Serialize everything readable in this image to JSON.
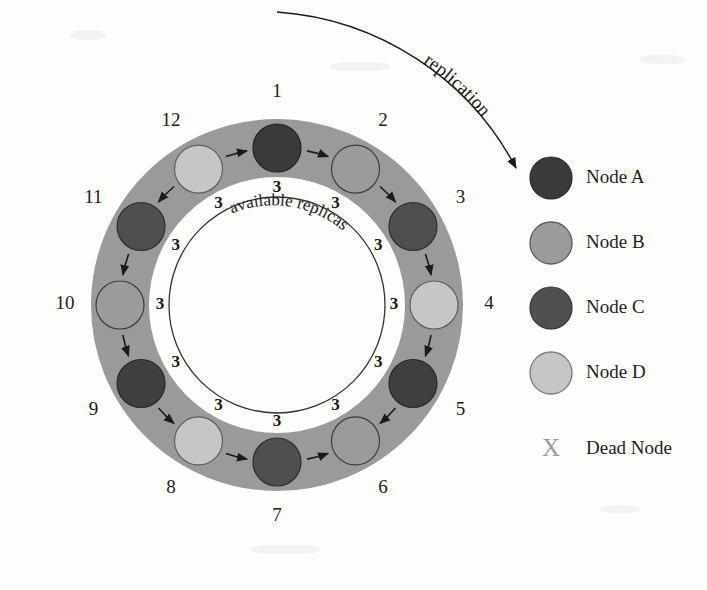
{
  "figure": {
    "title_visible": false,
    "background_color": "#fdfdfc",
    "ring_band_color": "#9a9a9a",
    "ring_inner_fill": "#ffffff",
    "arrow_color": "#1b1b1b",
    "curve_label": "replication",
    "inner_circle_label": "available replicas"
  },
  "ring": {
    "center_x": 277,
    "center_y": 305,
    "band_outer_radius": 186,
    "band_inner_radius": 128,
    "node_orbit_radius": 157,
    "node_radius": 24,
    "inner_circle_radius": 108,
    "replica_label_radius": 117,
    "position_label_radius": 212
  },
  "nodes": [
    {
      "position": "1",
      "node_type": "Node A",
      "color": "#3a3a3a",
      "angle_deg": -90
    },
    {
      "position": "2",
      "node_type": "Node B",
      "color": "#9b9b9b",
      "angle_deg": -60
    },
    {
      "position": "3",
      "node_type": "Node C",
      "color": "#4f4f4f",
      "angle_deg": -30
    },
    {
      "position": "4",
      "node_type": "Node D",
      "color": "#c6c6c6",
      "angle_deg": 0
    },
    {
      "position": "5",
      "node_type": "Node A",
      "color": "#3f3f3f",
      "angle_deg": 30
    },
    {
      "position": "6",
      "node_type": "Node B",
      "color": "#9b9b9b",
      "angle_deg": 60
    },
    {
      "position": "7",
      "node_type": "Node C",
      "color": "#4f4f4f",
      "angle_deg": 90
    },
    {
      "position": "8",
      "node_type": "Node D",
      "color": "#c6c6c6",
      "angle_deg": 120
    },
    {
      "position": "9",
      "node_type": "Node A",
      "color": "#3f3f3f",
      "angle_deg": 150
    },
    {
      "position": "10",
      "node_type": "Node B",
      "color": "#9b9b9b",
      "angle_deg": 180
    },
    {
      "position": "11",
      "node_type": "Node C",
      "color": "#4f4f4f",
      "angle_deg": 210
    },
    {
      "position": "12",
      "node_type": "Node D",
      "color": "#c6c6c6",
      "angle_deg": 240
    }
  ],
  "replica_counts": [
    {
      "value": "3",
      "angle_deg": -90
    },
    {
      "value": "3",
      "angle_deg": -60
    },
    {
      "value": "3",
      "angle_deg": -30
    },
    {
      "value": "3",
      "angle_deg": 0
    },
    {
      "value": "3",
      "angle_deg": 30
    },
    {
      "value": "3",
      "angle_deg": 60
    },
    {
      "value": "3",
      "angle_deg": 90
    },
    {
      "value": "3",
      "angle_deg": 120
    },
    {
      "value": "3",
      "angle_deg": 150
    },
    {
      "value": "3",
      "angle_deg": 180
    },
    {
      "value": "3",
      "angle_deg": 210
    },
    {
      "value": "3",
      "angle_deg": 240
    }
  ],
  "legend": {
    "items": [
      {
        "label": "Node A",
        "swatch": "circle",
        "color": "#3a3a3a",
        "stroke": "#2a2a2a"
      },
      {
        "label": "Node B",
        "swatch": "circle",
        "color": "#9b9b9b",
        "stroke": "#5a5a5a"
      },
      {
        "label": "Node C",
        "swatch": "circle",
        "color": "#4f4f4f",
        "stroke": "#333333"
      },
      {
        "label": "Node D",
        "swatch": "circle",
        "color": "#c6c6c6",
        "stroke": "#7a7a7a"
      },
      {
        "label": "Dead Node",
        "swatch": "x-mark",
        "color": "#9a9a9a",
        "stroke": "#9a9a9a"
      }
    ]
  },
  "chart_data": {
    "type": "diagram",
    "subtype": "consistent-hashing-ring",
    "title": "",
    "categories": [
      "1",
      "2",
      "3",
      "4",
      "5",
      "6",
      "7",
      "8",
      "9",
      "10",
      "11",
      "12"
    ],
    "series": [
      {
        "name": "node assignment",
        "values": [
          "Node A",
          "Node B",
          "Node C",
          "Node D",
          "Node A",
          "Node B",
          "Node C",
          "Node D",
          "Node A",
          "Node B",
          "Node C",
          "Node D"
        ]
      },
      {
        "name": "available replicas",
        "values": [
          3,
          3,
          3,
          3,
          3,
          3,
          3,
          3,
          3,
          3,
          3,
          3
        ]
      }
    ],
    "annotations": [
      "replication",
      "available replicas"
    ],
    "legend_entries": [
      "Node A",
      "Node B",
      "Node C",
      "Node D",
      "Dead Node"
    ],
    "legend_position": "right"
  }
}
